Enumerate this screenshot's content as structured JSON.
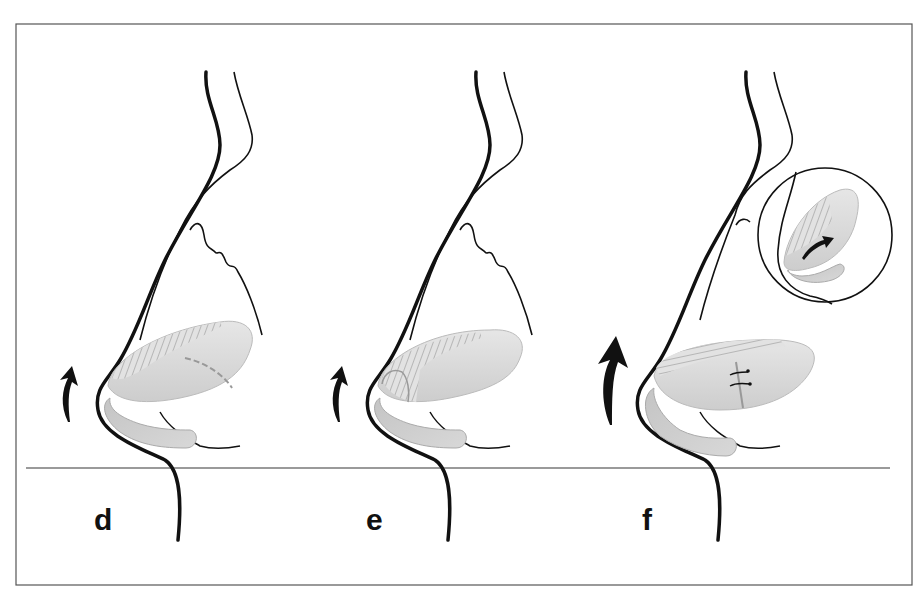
{
  "figure": {
    "frame": {
      "left": 16,
      "top": 24,
      "right": 912,
      "bottom": 585,
      "stroke": "#555555"
    },
    "baseline": {
      "y": 468,
      "x1": 26,
      "x2": 890,
      "color": "#9a9a9a"
    },
    "colors": {
      "outline": "#111111",
      "cartilage_fill": "#dcdcdc",
      "cartilage_shade": "#c8c8c8",
      "hatch": "#8a8a8a",
      "seam": "#9a9a9a",
      "arrow": "#111111"
    },
    "panels": [
      {
        "id": "d",
        "label": "d",
        "arrow_icon": "curved-up-arrow-small",
        "features": [
          "nasal-profile",
          "alar-cartilage-hatched",
          "dashed-incision-line"
        ]
      },
      {
        "id": "e",
        "label": "e",
        "arrow_icon": "curved-up-arrow-small",
        "features": [
          "nasal-profile",
          "alar-cartilage-hatched",
          "segmented-medial-crus"
        ]
      },
      {
        "id": "f",
        "label": "f",
        "arrow_icon": "curved-up-arrow-large",
        "features": [
          "nasal-profile",
          "alar-cartilage-hatched",
          "sutures",
          "inset-magnified-circle"
        ],
        "inset": {
          "arrow_icon": "curved-arrow-small"
        }
      }
    ]
  }
}
